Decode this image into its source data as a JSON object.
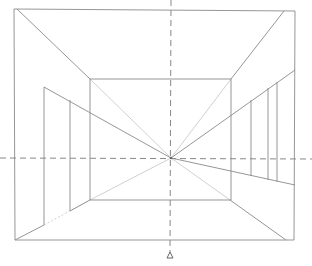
{
  "diagram": {
    "type": "one-point perspective room",
    "colors": {
      "line": "#8a8a8a",
      "guide": "#b8b8b8",
      "dash": "#7a7a7a",
      "background": "#ffffff"
    },
    "vanishing_point": {
      "x": 171,
      "y": 158
    },
    "horizon_line_y": 158,
    "center_line_x": 171,
    "outer_frame": {
      "x1": 14,
      "y1": 9,
      "x2": 295,
      "y2": 240
    },
    "back_wall": {
      "x1": 90,
      "y1": 79,
      "x2": 231,
      "y2": 200
    },
    "left_wall_lines": {
      "top": 87,
      "door_x": [
        44,
        70
      ]
    },
    "right_wall_lines": {
      "posts_x": [
        251,
        268,
        277
      ]
    },
    "station_point_marker": "triangle-icon"
  }
}
